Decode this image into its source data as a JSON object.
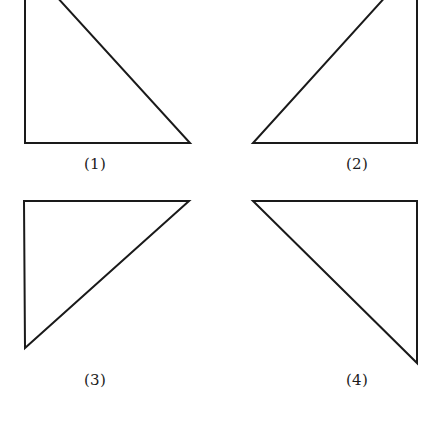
{
  "page": {
    "background_color": "#ffffff",
    "width": 440,
    "height": 423
  },
  "style": {
    "stroke_color": "#1a1a1a",
    "stroke_width": 2,
    "fill": "none",
    "label_color": "#1c1c1c",
    "label_font_size": 15
  },
  "figures": [
    {
      "id": "figure-1",
      "label": "(1)",
      "shape": "right-triangle",
      "right_angle_corner": "bottom-left",
      "hypotenuse_direction": "top-left-to-bottom-right",
      "clipped_at_top": true,
      "points": "25,-38 25,143 190,143",
      "label_x": 95,
      "label_y": 164
    },
    {
      "id": "figure-2",
      "label": "(2)",
      "shape": "right-triangle",
      "right_angle_corner": "bottom-right",
      "hypotenuse_direction": "bottom-left-to-top-right",
      "clipped_at_top": true,
      "points": "417,-38 417,143 253,143",
      "label_x": 357,
      "label_y": 164
    },
    {
      "id": "figure-3",
      "label": "(3)",
      "shape": "right-triangle",
      "right_angle_corner": "top-left",
      "hypotenuse_direction": "bottom-left-to-top-right",
      "clipped_at_top": false,
      "points": "24,201 189,201 25,348",
      "label_x": 95,
      "label_y": 380
    },
    {
      "id": "figure-4",
      "label": "(4)",
      "shape": "right-triangle",
      "right_angle_corner": "top-right",
      "hypotenuse_direction": "top-left-to-bottom-right",
      "clipped_at_top": false,
      "points": "253,201 417,201 417,363",
      "label_x": 357,
      "label_y": 380
    }
  ]
}
